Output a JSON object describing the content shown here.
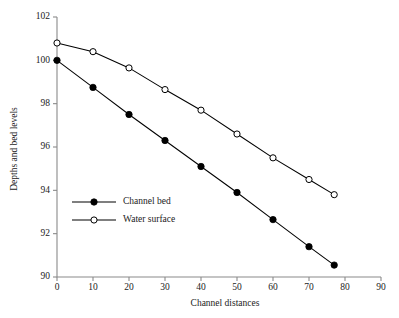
{
  "chart_data": {
    "type": "line",
    "title": "",
    "xlabel": "Channel distances",
    "ylabel": "Depths and bed levels",
    "xlim": [
      0,
      90
    ],
    "ylim": [
      90,
      102
    ],
    "xticks": [
      0,
      10,
      20,
      30,
      40,
      50,
      60,
      70,
      80,
      90
    ],
    "yticks": [
      90,
      92,
      94,
      96,
      98,
      100,
      102
    ],
    "grid": false,
    "legend_position": "inside-lower-left",
    "series": [
      {
        "name": "Channel bed",
        "marker": "filled-circle",
        "color": "#000000",
        "x": [
          0,
          10,
          20,
          30,
          40,
          50,
          60,
          70,
          77
        ],
        "values": [
          100.0,
          98.75,
          97.5,
          96.3,
          95.1,
          93.9,
          92.65,
          91.4,
          90.55
        ]
      },
      {
        "name": "Water surface",
        "marker": "open-circle",
        "color": "#000000",
        "x": [
          0,
          10,
          20,
          30,
          40,
          50,
          60,
          70,
          77
        ],
        "values": [
          100.8,
          100.4,
          99.65,
          98.65,
          97.7,
          96.6,
          95.5,
          94.5,
          93.8
        ]
      }
    ]
  },
  "legend": {
    "entries": [
      {
        "label": "Channel bed",
        "marker": "filled-circle"
      },
      {
        "label": "Water surface",
        "marker": "open-circle"
      }
    ]
  },
  "axes": {
    "y_title": "Depths and bed levels",
    "x_title": "Channel distances"
  }
}
